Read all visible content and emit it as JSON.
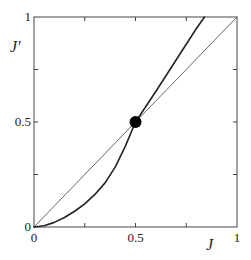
{
  "chart_data": {
    "type": "line",
    "title": "",
    "xlabel": "J",
    "ylabel": "J'",
    "xlim": [
      0,
      1
    ],
    "ylim": [
      0,
      1
    ],
    "grid": false,
    "legend": null,
    "x_ticks": [
      {
        "value": 0,
        "label": "0"
      },
      {
        "value": 0.5,
        "label": "0.5"
      },
      {
        "value": 1,
        "label": "1"
      }
    ],
    "y_ticks": [
      {
        "value": 0,
        "label": "0"
      },
      {
        "value": 0.5,
        "label": "0.5"
      },
      {
        "value": 1,
        "label": "1"
      }
    ],
    "minor_ticks": [
      0.25,
      0.75
    ],
    "series": [
      {
        "name": "identity J' = J",
        "style": "thin",
        "color": "#555555",
        "x": [
          0,
          1
        ],
        "y": [
          0,
          1
        ]
      },
      {
        "name": "recursion map J'(J)",
        "style": "thick",
        "color": "#222222",
        "x": [
          0,
          0.05,
          0.1,
          0.15,
          0.2,
          0.25,
          0.3,
          0.35,
          0.4,
          0.45,
          0.5,
          0.6,
          0.7,
          0.8,
          0.84
        ],
        "y": [
          0,
          0.006,
          0.022,
          0.045,
          0.075,
          0.11,
          0.155,
          0.21,
          0.285,
          0.385,
          0.5,
          0.645,
          0.795,
          0.945,
          1.0
        ]
      }
    ],
    "annotations": [
      {
        "type": "fixed-point-marker",
        "x": 0.5,
        "y": 0.5,
        "color": "#000000"
      }
    ]
  }
}
